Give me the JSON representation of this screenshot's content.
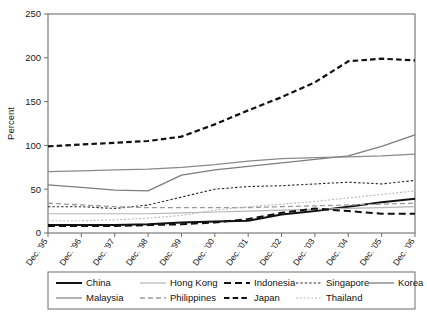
{
  "chart_data": {
    "type": "line",
    "title": "",
    "xlabel": "",
    "ylabel": "Percent",
    "ylim": [
      0,
      250
    ],
    "yticks": [
      0,
      50,
      100,
      150,
      200,
      250
    ],
    "grid": false,
    "legend_position": "bottom",
    "categories": [
      "Dec. '95",
      "Dec. '96",
      "Dec. '97",
      "Dec. '98",
      "Dec. '99",
      "Dec. '00",
      "Dec. '01",
      "Dec. '02",
      "Dec. '03",
      "Dec. '04",
      "Dec. '05",
      "Dec. '06"
    ],
    "series": [
      {
        "name": "China",
        "style": "solid",
        "color": "#111111",
        "width": 2.0,
        "dash": "",
        "values": [
          9,
          9,
          9,
          10,
          12,
          13,
          14,
          21,
          25,
          30,
          35,
          39
        ]
      },
      {
        "name": "Hong Kong",
        "style": "solid",
        "color": "#b5b5b5",
        "width": 1.2,
        "dash": "",
        "values": [
          22,
          22,
          22,
          22,
          23,
          24,
          25,
          26,
          27,
          28,
          29,
          30
        ]
      },
      {
        "name": "Indonesia",
        "style": "dashed",
        "color": "#111111",
        "width": 2.0,
        "dash": "7,4",
        "values": [
          8,
          8,
          8,
          9,
          10,
          12,
          16,
          23,
          28,
          25,
          22,
          22
        ]
      },
      {
        "name": "Singapore",
        "style": "dotted",
        "color": "#2a2a2a",
        "width": 1.1,
        "dash": "2.4,2.0",
        "values": [
          30,
          30,
          28,
          32,
          41,
          50,
          53,
          54,
          56,
          58,
          56,
          60
        ]
      },
      {
        "name": "Korea",
        "style": "solid",
        "color": "#7d7d7d",
        "width": 1.3,
        "dash": "",
        "values": [
          55,
          52,
          49,
          48,
          66,
          72,
          76,
          80,
          84,
          88,
          99,
          112
        ]
      },
      {
        "name": "Malaysia",
        "style": "solid",
        "color": "#8a8a8a",
        "width": 1.3,
        "dash": "",
        "values": [
          70,
          71,
          72,
          73,
          75,
          78,
          82,
          85,
          86,
          87,
          88,
          90
        ]
      },
      {
        "name": "Philippines",
        "style": "dashed",
        "color": "#9a9a9a",
        "width": 1.3,
        "dash": "5,3",
        "values": [
          34,
          32,
          30,
          29,
          29,
          29,
          29,
          30,
          31,
          32,
          33,
          34
        ]
      },
      {
        "name": "Japan",
        "style": "dashed-bold",
        "color": "#111111",
        "width": 2.2,
        "dash": "5.5,3.2",
        "values": [
          99,
          101,
          103,
          105,
          110,
          124,
          140,
          155,
          172,
          196,
          199,
          197
        ]
      },
      {
        "name": "Thailand",
        "style": "dotted-light",
        "color": "#bdbdbd",
        "width": 1.2,
        "dash": "2.0,1.8",
        "values": [
          14,
          14,
          15,
          17,
          20,
          26,
          30,
          33,
          36,
          40,
          44,
          48
        ]
      }
    ]
  },
  "legend": {
    "row1": [
      "China",
      "Hong Kong",
      "Indonesia",
      "Singapore",
      "Korea"
    ],
    "row2": [
      "Malaysia",
      "Philippines",
      "Japan",
      "Thailand"
    ]
  }
}
